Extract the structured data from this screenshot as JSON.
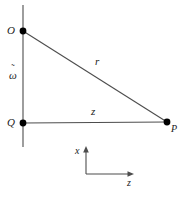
{
  "figure": {
    "background_color": "#ffffff",
    "line_color": "#4d4d4d",
    "point_color": "#000000",
    "text_color": "#1a1a1a",
    "width": 189,
    "height": 200
  },
  "points": [
    {
      "id": "O",
      "label": "O",
      "x": 23,
      "y": 31,
      "label_x": 7,
      "label_y": 25,
      "description": "source point on vertical axis"
    },
    {
      "id": "Q",
      "label": "Q",
      "x": 23,
      "y": 123,
      "label_x": 7,
      "label_y": 117,
      "description": "origin at intersection of vertical and horizontal lines"
    },
    {
      "id": "P",
      "label": "P",
      "x": 167,
      "y": 122,
      "label_x": 171,
      "label_y": 124,
      "description": "field point at right end of horizontal line"
    }
  ],
  "segments": [
    {
      "id": "vertical-axis",
      "label": "",
      "x1": 23,
      "y1": 5,
      "x2": 23,
      "y2": 147
    },
    {
      "id": "horizontal-line",
      "label": "z",
      "label_x": 91,
      "label_y": 106,
      "x1": 23,
      "y1": 123,
      "x2": 167,
      "y2": 122
    },
    {
      "id": "hypotenuse",
      "label": "r",
      "label_x": 95,
      "label_y": 56,
      "x1": 23,
      "y1": 31,
      "x2": 167,
      "y2": 122
    }
  ],
  "distance_labels": [
    {
      "id": "omega-tilde",
      "base": "ω",
      "accent": "˜",
      "x": 9,
      "y": 70,
      "description": "tilde-omega: distance from O to Q along vertical axis"
    }
  ],
  "axes": {
    "origin_x": 86,
    "origin_y": 174,
    "vertical": {
      "label": "x",
      "label_x": 75,
      "label_y": 146,
      "tip_x": 86,
      "tip_y": 147
    },
    "horizontal": {
      "label": "z",
      "label_x": 127,
      "label_y": 178,
      "tip_x": 133,
      "tip_y": 174
    }
  }
}
